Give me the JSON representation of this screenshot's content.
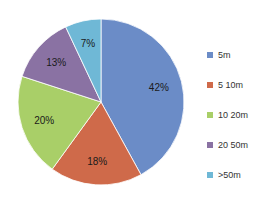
{
  "chart_data": {
    "type": "pie",
    "title": "",
    "categories": [
      " 5m",
      "5  10m",
      "10  20m",
      "20  50m",
      ">50m"
    ],
    "values": [
      42,
      18,
      20,
      13,
      7
    ],
    "labels": [
      "42%",
      "18%",
      "20%",
      "13%",
      "7%"
    ],
    "colors": [
      "#6b8cc7",
      "#cf6a4a",
      "#a9cf68",
      "#8a72a3",
      "#6fb8d6"
    ],
    "legend_position": "right",
    "start_angle_deg": 0,
    "direction": "clockwise"
  },
  "legend": {
    "items": [
      {
        "label": " 5m",
        "color": "#6b8cc7"
      },
      {
        "label": "5  10m",
        "color": "#cf6a4a"
      },
      {
        "label": "10  20m",
        "color": "#a9cf68"
      },
      {
        "label": "20  50m",
        "color": "#8a72a3"
      },
      {
        "label": ">50m",
        "color": "#6fb8d6"
      }
    ]
  }
}
